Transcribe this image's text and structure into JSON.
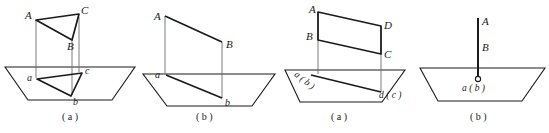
{
  "figures": [
    {
      "id": "triangular-prism-projection",
      "caption": "( a )",
      "labels": {
        "upper": [
          "A",
          "C",
          "B"
        ],
        "lower": [
          "a",
          "c",
          "b"
        ]
      }
    },
    {
      "id": "segment-oblique-projection",
      "caption": "( b )",
      "labels": {
        "upper": [
          "A",
          "B"
        ],
        "lower": [
          "a",
          "b"
        ]
      }
    },
    {
      "id": "parallelogram-edge-on-projection",
      "caption": "( a )",
      "labels": {
        "upper": [
          "A",
          "D",
          "B",
          "C"
        ],
        "lower": [
          "a ( b )",
          "d ( c )"
        ]
      }
    },
    {
      "id": "vertical-segment-point-projection",
      "caption": "( b )",
      "labels": {
        "upper": [
          "A",
          "B"
        ],
        "lower": [
          "a ( b )"
        ]
      }
    }
  ],
  "style": {
    "stroke": "#1a1a1a",
    "thin_stroke": "#555555",
    "background": "#ffffff"
  }
}
